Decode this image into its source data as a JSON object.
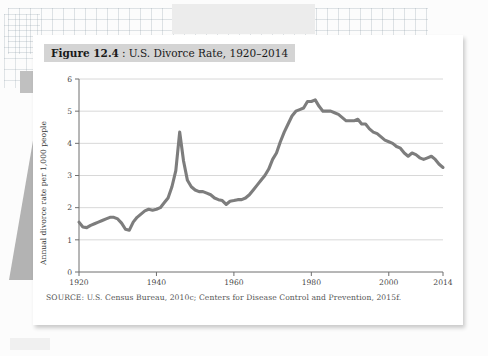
{
  "figure": {
    "label": "Figure 12.4",
    "title_rest": ": U.S. Divorce Rate, 1920–2014",
    "source": "SOURCE: U.S. Census Bureau, 2010c; Centers for Disease Control and Prevention, 2015f."
  },
  "colors": {
    "line": "#7d7d7d",
    "gridline": "#d8d8d8",
    "axis": "#6f6f6f",
    "title_band": "#d4d4d4",
    "card": "#ffffff",
    "page": "#fcfcfc"
  },
  "chart_data": {
    "type": "line",
    "xlabel": "",
    "ylabel": "Annual divorce rate per 1,000 people",
    "xlim": [
      1920,
      2014
    ],
    "ylim": [
      0,
      6
    ],
    "xticks": [
      1920,
      1940,
      1960,
      1980,
      2000,
      2014
    ],
    "yticks": [
      0,
      1,
      2,
      3,
      4,
      5,
      6
    ],
    "grid": "horizontal",
    "legend": "none",
    "series": [
      {
        "name": "Annual divorce rate per 1,000 people",
        "x": [
          1920,
          1921,
          1922,
          1923,
          1924,
          1925,
          1926,
          1927,
          1928,
          1929,
          1930,
          1931,
          1932,
          1933,
          1934,
          1935,
          1936,
          1937,
          1938,
          1939,
          1940,
          1941,
          1942,
          1943,
          1944,
          1945,
          1946,
          1947,
          1948,
          1949,
          1950,
          1951,
          1952,
          1953,
          1954,
          1955,
          1956,
          1957,
          1958,
          1959,
          1960,
          1961,
          1962,
          1963,
          1964,
          1965,
          1966,
          1967,
          1968,
          1969,
          1970,
          1971,
          1972,
          1973,
          1974,
          1975,
          1976,
          1977,
          1978,
          1979,
          1980,
          1981,
          1982,
          1983,
          1984,
          1985,
          1986,
          1987,
          1988,
          1989,
          1990,
          1991,
          1992,
          1993,
          1994,
          1995,
          1996,
          1997,
          1998,
          1999,
          2000,
          2001,
          2002,
          2003,
          2004,
          2005,
          2006,
          2007,
          2008,
          2009,
          2010,
          2011,
          2012,
          2013,
          2014
        ],
        "values": [
          1.55,
          1.4,
          1.38,
          1.45,
          1.5,
          1.55,
          1.6,
          1.65,
          1.7,
          1.7,
          1.65,
          1.52,
          1.33,
          1.3,
          1.55,
          1.7,
          1.8,
          1.9,
          1.95,
          1.92,
          1.95,
          2.0,
          2.15,
          2.3,
          2.65,
          3.15,
          4.35,
          3.45,
          2.85,
          2.65,
          2.55,
          2.5,
          2.5,
          2.45,
          2.4,
          2.3,
          2.25,
          2.22,
          2.1,
          2.2,
          2.22,
          2.25,
          2.25,
          2.3,
          2.4,
          2.55,
          2.7,
          2.85,
          3.0,
          3.2,
          3.5,
          3.7,
          4.05,
          4.35,
          4.6,
          4.85,
          5.0,
          5.05,
          5.1,
          5.3,
          5.3,
          5.35,
          5.15,
          5.0,
          5.0,
          5.0,
          4.95,
          4.9,
          4.8,
          4.7,
          4.7,
          4.7,
          4.75,
          4.6,
          4.6,
          4.45,
          4.35,
          4.3,
          4.2,
          4.1,
          4.05,
          4.0,
          3.9,
          3.85,
          3.7,
          3.6,
          3.7,
          3.65,
          3.55,
          3.5,
          3.55,
          3.6,
          3.5,
          3.35,
          3.25
        ]
      }
    ]
  }
}
